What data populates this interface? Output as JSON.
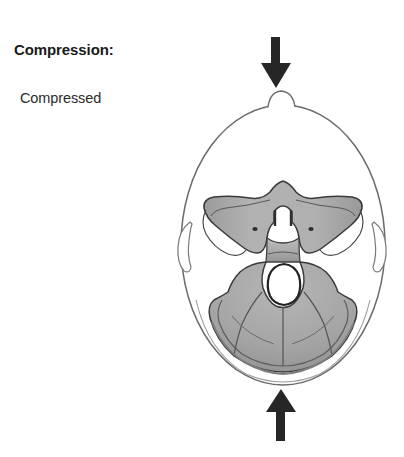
{
  "figure": {
    "title_label": "Compression:",
    "state_label": "Compressed",
    "caption_title_name": "compression-title",
    "caption_state_name": "compression-state"
  },
  "colors": {
    "background": "#ffffff",
    "text_bold": "#1a1a1a",
    "text_regular": "#2b2b2b",
    "head_outline": "#6b6b6b",
    "bone_fill": "#a8a8a8",
    "bone_fill_light": "#b8b8b8",
    "bone_fill_dark": "#979797",
    "bone_outline": "#3a3a3a",
    "foramen_fill": "#ffffff",
    "arrow_fill": "#262626"
  },
  "diagram": {
    "view": "superior view of skull base with cranial compression force vectors",
    "head": {
      "name": "head-outline",
      "center_x": 283,
      "center_y": 245,
      "radius_x": 102,
      "radius_y": 140
    },
    "nose": {
      "name": "nose-bump",
      "x": 281,
      "y": 98
    },
    "ears": [
      {
        "name": "left-ear",
        "side": "left",
        "x": 184,
        "y": 246
      },
      {
        "name": "right-ear",
        "side": "right",
        "x": 379,
        "y": 247
      }
    ],
    "bones": [
      {
        "name": "sphenoid-bone",
        "label": "sphenoid greater wings"
      },
      {
        "name": "occipital-bone",
        "label": "occipital bone"
      },
      {
        "name": "foramen-magnum",
        "label": "foramen magnum"
      }
    ],
    "arrows": [
      {
        "name": "compression-arrow-top",
        "direction": "down",
        "tip_x": 276,
        "tip_y": 87,
        "tail_y": 38
      },
      {
        "name": "compression-arrow-bottom",
        "direction": "up",
        "tip_x": 281,
        "tip_y": 389,
        "tail_y": 441
      }
    ]
  }
}
